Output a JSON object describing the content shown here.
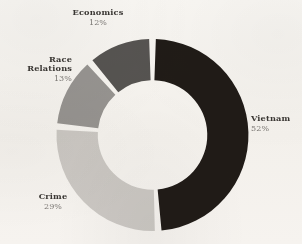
{
  "figure": {
    "background_color": "#fbfaf8",
    "name_text_color": "#3b3835",
    "percent_text_color": "#7d7a77"
  },
  "chart_data": {
    "type": "pie",
    "variant": "donut",
    "title": "",
    "subtitle": "",
    "xlabel": "",
    "ylabel": "",
    "legend_position": "none",
    "grid": false,
    "labels_placement": "outside-callout",
    "hole_ratio": 0.57,
    "start_angle_deg": 0,
    "direction": "clockwise",
    "segment_gap_deg": 4,
    "categories": [
      "Vietnam",
      "Crime",
      "Race Relations",
      "Economics"
    ],
    "values": [
      52,
      29,
      13,
      12
    ],
    "value_suffix": "%",
    "colors": [
      "#211c18",
      "#d0cecb",
      "#9a9896",
      "#585654"
    ],
    "slices": [
      {
        "label": "Vietnam",
        "label_line1": "Vietnam",
        "label_line2": "",
        "value": 52,
        "value_text": "52%",
        "color": "#211c18",
        "position": "right"
      },
      {
        "label": "Crime",
        "label_line1": "Crime",
        "label_line2": "",
        "value": 29,
        "value_text": "29%",
        "color": "#d0cecb",
        "position": "bottom-left"
      },
      {
        "label": "Race Relations",
        "label_line1": "Race",
        "label_line2": "Relations",
        "value": 13,
        "value_text": "13%",
        "color": "#9a9896",
        "position": "left"
      },
      {
        "label": "Economics",
        "label_line1": "Economics",
        "label_line2": "",
        "value": 12,
        "value_text": "12%",
        "color": "#585654",
        "position": "top"
      }
    ]
  }
}
